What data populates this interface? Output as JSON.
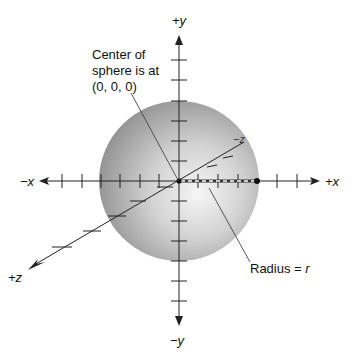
{
  "figure": {
    "type": "sphere-coordinate-diagram",
    "center": {
      "x": 179,
      "y": 181
    },
    "radius_px": 80,
    "colors": {
      "axis": "#222222",
      "sphere_light": "#f4f4f4",
      "sphere_dark": "#8a8a8a",
      "radius_dash": "#ffffff"
    }
  },
  "axes": {
    "pos_y": "+y",
    "neg_y": "−y",
    "neg_x": "−x",
    "pos_x": "+x",
    "pos_z": "+z",
    "neg_z": "−z"
  },
  "annotations": {
    "center_line1": "Center of",
    "center_line2": "sphere is at",
    "center_line3": "(0, 0, 0)",
    "radius_prefix": "Radius = ",
    "radius_var": "r"
  }
}
